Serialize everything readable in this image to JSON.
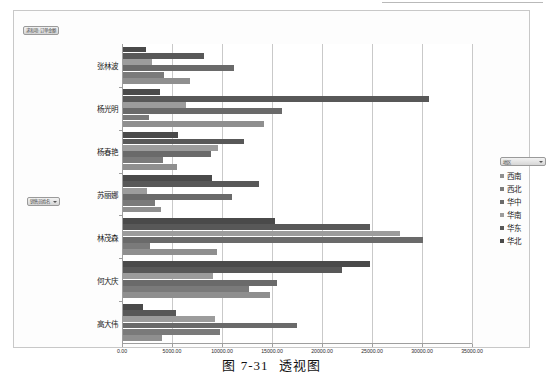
{
  "figure": {
    "caption_number": "图 7-31",
    "caption_title": "透视图"
  },
  "pivot": {
    "value_field_button": "求和项:订单金额",
    "axis_field_button": "销售员姓名",
    "legend_field_button": "地区"
  },
  "legend": {
    "position": "right",
    "items": [
      {
        "label": "西南",
        "color": "#8f8f8f"
      },
      {
        "label": "西北",
        "color": "#7a7a7a"
      },
      {
        "label": "华中",
        "color": "#6a6a6a"
      },
      {
        "label": "华南",
        "color": "#9c9c9c"
      },
      {
        "label": "华东",
        "color": "#585858"
      },
      {
        "label": "华北",
        "color": "#4a4a4a"
      }
    ]
  },
  "chart_data": {
    "type": "bar",
    "orientation": "horizontal",
    "title": "",
    "xlabel": "",
    "ylabel": "",
    "xlim": [
      0,
      35000
    ],
    "xtick_step": 5000,
    "xticks": [
      0,
      5000,
      10000,
      15000,
      20000,
      25000,
      30000,
      35000
    ],
    "xtick_labels": [
      "0.00",
      "5000.00",
      "10000.00",
      "15000.00",
      "20000.00",
      "25000.00",
      "30000.00",
      "35000.00"
    ],
    "grid": true,
    "legend_position": "right",
    "categories": [
      "张林波",
      "杨光明",
      "杨春艳",
      "苏丽娜",
      "林茂森",
      "何大庆",
      "高大伟"
    ],
    "series": [
      {
        "name": "西南",
        "color": "#8f8f8f",
        "values": [
          6800,
          14200,
          5500,
          3900,
          9500,
          14800,
          4000
        ]
      },
      {
        "name": "西北",
        "color": "#7a7a7a",
        "values": [
          4200,
          2700,
          4100,
          3300,
          2800,
          12700,
          9800
        ]
      },
      {
        "name": "华中",
        "color": "#6a6a6a",
        "values": [
          11200,
          16000,
          8900,
          11000,
          30100,
          15500,
          17500
        ]
      },
      {
        "name": "华南",
        "color": "#9c9c9c",
        "values": [
          3000,
          6400,
          9600,
          2500,
          27800,
          9100,
          9300
        ]
      },
      {
        "name": "华东",
        "color": "#585858",
        "values": [
          8200,
          30700,
          12200,
          13700,
          24800,
          22000,
          5400
        ]
      },
      {
        "name": "华北",
        "color": "#4a4a4a",
        "values": [
          2400,
          3800,
          5600,
          9000,
          15300,
          24800,
          2100
        ]
      }
    ]
  }
}
